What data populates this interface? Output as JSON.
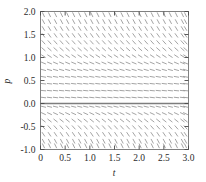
{
  "chart_data": {
    "type": "scatter",
    "subtype": "slope-field",
    "title": "",
    "xlabel": "t",
    "ylabel": "p",
    "xlim": [
      0,
      3
    ],
    "ylim": [
      -1,
      2
    ],
    "grid": false,
    "legend": null,
    "xticks": [
      0,
      0.5,
      1,
      1.5,
      2,
      2.5,
      3
    ],
    "xtick_labels": [
      "0",
      "0.5",
      "1.0",
      "1.5",
      "2.0",
      "2.5",
      "3.0"
    ],
    "yticks": [
      -1,
      -0.5,
      0,
      0.5,
      1,
      1.5,
      2
    ],
    "ytick_labels": [
      "-1.0",
      "-0.5",
      "0.0",
      "0.5",
      "1.0",
      "1.5",
      "2.0"
    ],
    "field": {
      "description": "Direction field of dp/dt = p(1 - p) - style autonomous equation; tick slopes vary with p only",
      "n_cols": 25,
      "n_rows": 21,
      "t_samples": [
        0.06,
        0.1825,
        0.305,
        0.4275,
        0.55,
        0.6725,
        0.795,
        0.9175,
        1.04,
        1.1625,
        1.285,
        1.4075,
        1.53,
        1.6525,
        1.775,
        1.8975,
        2.02,
        2.1425,
        2.265,
        2.3875,
        2.51,
        2.6325,
        2.755,
        2.8775,
        2.94
      ],
      "p_samples": [
        1.93,
        1.78,
        1.63,
        1.48,
        1.33,
        1.18,
        1.03,
        0.88,
        0.73,
        0.58,
        0.43,
        0.28,
        0.13,
        -0.07,
        -0.22,
        -0.37,
        -0.52,
        -0.67,
        -0.82,
        -0.92,
        -0.97
      ],
      "slopes_by_p": [
        -2.2,
        -2.0,
        -1.75,
        -1.5,
        -1.2,
        -0.95,
        -0.7,
        -0.45,
        -0.3,
        -0.18,
        -0.12,
        -0.1,
        -0.12,
        -0.25,
        -0.5,
        -0.85,
        -1.2,
        -1.6,
        -2.0,
        -2.2,
        -2.3
      ]
    },
    "equilibrium_lines": [
      {
        "p": 0,
        "style": "solid",
        "color": "#7d7d7d"
      }
    ],
    "colors": {
      "field_stroke": "#9a9a9a",
      "frame": "#808080",
      "text": "#2b2b2b",
      "equilibrium": "#7d7d7d"
    }
  },
  "figure": {
    "width": 206,
    "height": 182,
    "background": "#ffffff"
  }
}
